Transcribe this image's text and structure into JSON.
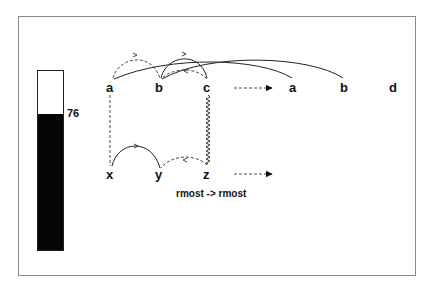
{
  "gauge": {
    "value": 76,
    "value_label": "76",
    "fill_color": "#050505",
    "max": 100
  },
  "diagram": {
    "top_row": {
      "source_nodes": [
        "a",
        "b",
        "c"
      ],
      "target_nodes": [
        "a",
        "b",
        "d"
      ]
    },
    "bottom_row": {
      "source_nodes": [
        "x",
        "y",
        "z"
      ]
    },
    "caption": "rmost -> rmost"
  }
}
